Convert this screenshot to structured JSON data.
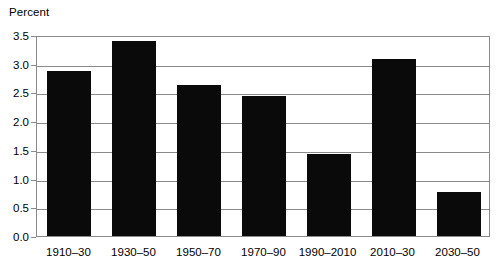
{
  "chart_data": {
    "type": "bar",
    "title": "",
    "subtitle": "",
    "xlabel": "",
    "ylabel": "Percent",
    "categories": [
      "1910–30",
      "1930–50",
      "1950–70",
      "1970–90",
      "1990–2010",
      "2010–30",
      "2030–50"
    ],
    "values": [
      2.87,
      3.4,
      2.63,
      2.43,
      1.42,
      3.09,
      0.77
    ],
    "ylim": [
      0.0,
      3.5
    ],
    "ytick_labels": [
      "3.5",
      "3.0",
      "2.5",
      "2.0",
      "1.5",
      "1.0",
      "0.5",
      "0.0"
    ],
    "ytick_values": [
      3.5,
      3.0,
      2.5,
      2.0,
      1.5,
      1.0,
      0.5,
      0.0
    ],
    "grid": true,
    "grid_axis": "y",
    "legend": false,
    "legend_position": "none",
    "annotations": [],
    "colors": {
      "bar": "#0a0a0a",
      "grid": "#8a8a8a",
      "axis": "#8a8a8a",
      "text": "#000000",
      "background": "#ffffff"
    }
  }
}
